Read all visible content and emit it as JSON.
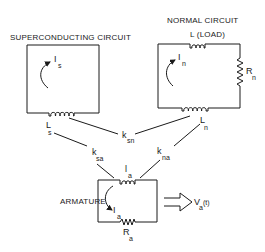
{
  "diagram": {
    "superconducting": {
      "title": "SUPERCONDUCTING CIRCUIT",
      "current_symbol": "I",
      "current_sub": "s",
      "inductor_symbol": "L",
      "inductor_sub": "s"
    },
    "normal": {
      "title": "NORMAL CIRCUIT",
      "load_label": "L (LOAD)",
      "current_symbol": "I",
      "current_sub": "n",
      "resistor_symbol": "R",
      "resistor_sub": "n",
      "inductor_symbol": "L",
      "inductor_sub": "n"
    },
    "couplings": {
      "sn": {
        "symbol": "k",
        "sub": "sn"
      },
      "sa": {
        "symbol": "k",
        "sub": "sa"
      },
      "na": {
        "symbol": "k",
        "sub": "na"
      }
    },
    "armature": {
      "title": "ARMATURE",
      "inductor_symbol": "l",
      "inductor_sub": "a",
      "current_symbol": "I",
      "current_sub": "a",
      "resistor_symbol": "R",
      "resistor_sub": "a",
      "output_symbol": "V",
      "output_sub": "a",
      "output_suffix": "(t)"
    }
  }
}
